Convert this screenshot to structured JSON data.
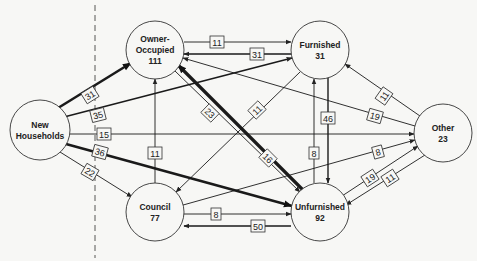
{
  "diagram": {
    "divider": {
      "x": 95
    },
    "nodes": [
      {
        "id": "new",
        "line1": "New",
        "line2": "Households",
        "cx": 40,
        "cy": 130,
        "r": 30
      },
      {
        "id": "owner",
        "line1": "Owner-",
        "line2": "Occupied",
        "line3": "111",
        "cx": 155,
        "cy": 50,
        "r": 29
      },
      {
        "id": "furnished",
        "line1": "Furnished",
        "line2": "31",
        "cx": 320,
        "cy": 50,
        "r": 29
      },
      {
        "id": "other",
        "line1": "Other",
        "line2": "23",
        "cx": 443,
        "cy": 133,
        "r": 29
      },
      {
        "id": "council",
        "line1": "Council",
        "line2": "77",
        "cx": 155,
        "cy": 212,
        "r": 29
      },
      {
        "id": "unfurnished",
        "line1": "Unfurnished",
        "line2": "92",
        "cx": 320,
        "cy": 212,
        "r": 29
      }
    ],
    "edges": [
      {
        "from": "new",
        "to": "owner",
        "label": "31",
        "w": 2.6,
        "x1": 58,
        "y1": 108,
        "x2": 131,
        "y2": 63,
        "lx": 90,
        "ly": 95,
        "rot": -32
      },
      {
        "from": "new",
        "to": "furnished",
        "label": "35",
        "w": 1.6,
        "x1": 64,
        "y1": 117,
        "x2": 292,
        "y2": 58,
        "lx": 98,
        "ly": 115,
        "rot": -14
      },
      {
        "from": "new",
        "to": "other",
        "label": "15",
        "w": 0.9,
        "x1": 70,
        "y1": 134,
        "x2": 414,
        "y2": 134,
        "lx": 104,
        "ly": 134,
        "rot": 0
      },
      {
        "from": "new",
        "to": "unfurnished",
        "label": "36",
        "w": 2.6,
        "x1": 66,
        "y1": 144,
        "x2": 292,
        "y2": 206,
        "lx": 100,
        "ly": 152,
        "rot": 15
      },
      {
        "from": "new",
        "to": "council",
        "label": "22",
        "w": 0.9,
        "x1": 60,
        "y1": 152,
        "x2": 132,
        "y2": 197,
        "lx": 90,
        "ly": 172,
        "rot": 30
      },
      {
        "from": "owner",
        "to": "furnished",
        "label": "11",
        "w": 0.9,
        "x1": 184,
        "y1": 42,
        "x2": 291,
        "y2": 42,
        "lx": 217,
        "ly": 42,
        "rot": 0
      },
      {
        "from": "furnished",
        "to": "owner",
        "label": "31",
        "w": 1.4,
        "x1": 291,
        "y1": 54,
        "x2": 184,
        "y2": 54,
        "lx": 257,
        "ly": 54,
        "rot": 0
      },
      {
        "from": "owner",
        "to": "unfurnished",
        "label": "23",
        "w": 0.9,
        "x1": 175,
        "y1": 71,
        "x2": 300,
        "y2": 192,
        "lx": 210,
        "ly": 113,
        "rot": 44
      },
      {
        "from": "unfurnished",
        "to": "owner",
        "label": "16",
        "w": 3.2,
        "x1": 303,
        "y1": 190,
        "x2": 178,
        "y2": 65,
        "lx": 268,
        "ly": 158,
        "rot": 45
      },
      {
        "from": "council",
        "to": "owner",
        "label": "11",
        "w": 0.9,
        "x1": 155,
        "y1": 183,
        "x2": 155,
        "y2": 79,
        "lx": 155,
        "ly": 153,
        "rot": 0
      },
      {
        "from": "furnished",
        "to": "council",
        "label": "11",
        "w": 0.9,
        "x1": 300,
        "y1": 72,
        "x2": 176,
        "y2": 192,
        "lx": 257,
        "ly": 110,
        "rot": -44
      },
      {
        "from": "other",
        "to": "owner",
        "label": "19",
        "w": 0.9,
        "x1": 415,
        "y1": 126,
        "x2": 183,
        "y2": 58,
        "lx": 375,
        "ly": 116,
        "rot": 16
      },
      {
        "from": "unfurnished",
        "to": "furnished",
        "label": "8",
        "w": 0.9,
        "x1": 314,
        "y1": 183,
        "x2": 314,
        "y2": 79,
        "lx": 314,
        "ly": 153,
        "rot": 0
      },
      {
        "from": "furnished",
        "to": "unfurnished",
        "label": "46",
        "w": 1.4,
        "x1": 328,
        "y1": 78,
        "x2": 328,
        "y2": 183,
        "lx": 328,
        "ly": 118,
        "rot": 0
      },
      {
        "from": "other",
        "to": "furnished",
        "label": "11",
        "w": 0.9,
        "x1": 420,
        "y1": 116,
        "x2": 345,
        "y2": 64,
        "lx": 384,
        "ly": 96,
        "rot": -55
      },
      {
        "from": "unfurnished",
        "to": "other",
        "label": "8",
        "w": 0.9,
        "x1": 176,
        "y1": 207,
        "x2": 415,
        "y2": 140,
        "lx": 378,
        "ly": 152,
        "rot": -15
      },
      {
        "from": "unfurnished",
        "to": "other",
        "label": "19",
        "w": 0.9,
        "x1": 342,
        "y1": 196,
        "x2": 418,
        "y2": 146,
        "lx": 370,
        "ly": 178,
        "rot": -33
      },
      {
        "from": "other",
        "to": "unfurnished",
        "label": "11",
        "w": 0.9,
        "x1": 425,
        "y1": 155,
        "x2": 346,
        "y2": 205,
        "lx": 390,
        "ly": 178,
        "rot": -33
      },
      {
        "from": "council",
        "to": "unfurnished",
        "label": "8",
        "w": 0.9,
        "x1": 184,
        "y1": 214,
        "x2": 291,
        "y2": 214,
        "lx": 216,
        "ly": 214,
        "rot": 0
      },
      {
        "from": "unfurnished",
        "to": "council",
        "label": "50",
        "w": 1.6,
        "x1": 291,
        "y1": 226,
        "x2": 184,
        "y2": 226,
        "lx": 258,
        "ly": 226,
        "rot": 0
      }
    ]
  }
}
